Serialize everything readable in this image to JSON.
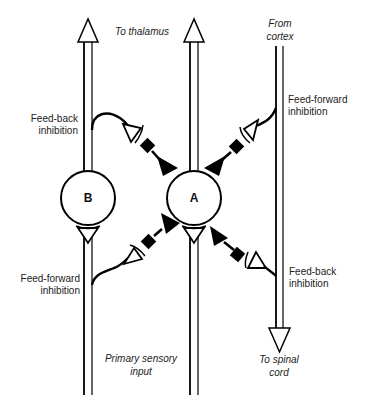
{
  "diagram": {
    "type": "neural-circuit",
    "neurons": [
      {
        "id": "A",
        "label": "A"
      },
      {
        "id": "B",
        "label": "B"
      }
    ],
    "labels": {
      "to_thalamus": "To thalamus",
      "from_cortex_line1": "From",
      "from_cortex_line2": "cortex",
      "feedback_left_line1": "Feed-back",
      "feedback_left_line2": "inhibition",
      "feedforward_right_line1": "Feed-forward",
      "feedforward_right_line2": "inhibition",
      "feedforward_left_line1": "Feed-forward",
      "feedforward_left_line2": "inhibition",
      "feedback_right_line1": "Feed-back",
      "feedback_right_line2": "inhibition",
      "primary_input_line1": "Primary sensory",
      "primary_input_line2": "input",
      "to_spinal_line1": "To spinal",
      "to_spinal_line2": "cord"
    },
    "colors": {
      "stroke": "#000000",
      "fill_synapse": "#000000",
      "background": "#ffffff"
    }
  }
}
